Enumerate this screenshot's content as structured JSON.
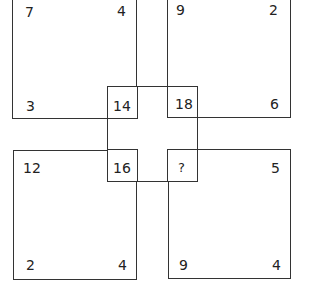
{
  "puzzle": {
    "top_left": {
      "tl": "7",
      "tr": "4",
      "bl": "3",
      "br": "14"
    },
    "top_right": {
      "tl": "9",
      "tr": "2",
      "bl": "18",
      "br": "6"
    },
    "bottom_left": {
      "tl": "12",
      "tr": "16",
      "bl": "2",
      "br": "4"
    },
    "bottom_right": {
      "tl": "?",
      "tr": "5",
      "bl": "9",
      "br": "4"
    }
  }
}
